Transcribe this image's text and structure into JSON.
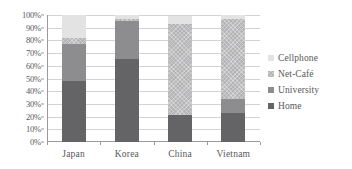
{
  "chart_data": {
    "type": "bar",
    "subtype": "100% stacked column",
    "title": "",
    "subtitle": "",
    "xlabel": "",
    "ylabel": "",
    "categories": [
      "Japan",
      "Korea",
      "China",
      "Vietnam"
    ],
    "series": [
      {
        "name": "Home",
        "color": "#646466",
        "values": [
          48,
          65,
          21,
          23
        ]
      },
      {
        "name": "University",
        "color": "#8d8d8f",
        "values": [
          29,
          30,
          0,
          11
        ]
      },
      {
        "name": "Net-Café",
        "color": "#b4b4b6",
        "values": [
          5,
          2,
          72,
          63
        ]
      },
      {
        "name": "Cellphone",
        "color": "#e3e3e4",
        "values": [
          18,
          3,
          6,
          3
        ]
      }
    ],
    "cumulative_tops": {
      "Japan": {
        "Home": 48,
        "University": 77,
        "Net-Café": 82,
        "Cellphone": 100
      },
      "Korea": {
        "Home": 65,
        "University": 95,
        "Net-Café": 97,
        "Cellphone": 100
      },
      "China": {
        "Home": 21,
        "University": 21,
        "Net-Café": 93,
        "Cellphone": 99
      },
      "Vietnam": {
        "Home": 23,
        "University": 34,
        "Net-Café": 97,
        "Cellphone": 100
      }
    },
    "ylim": [
      0,
      100
    ],
    "y_tick_labels": [
      "100%",
      "90%",
      "80%",
      "70%",
      "60%",
      "50%",
      "40%",
      "30%",
      "20%",
      "10%",
      "0%"
    ],
    "y_tick_values": [
      100,
      90,
      80,
      70,
      60,
      50,
      40,
      30,
      20,
      10,
      0
    ],
    "grid": true,
    "grid_axis": "y",
    "legend_position": "right",
    "legend_order_top_to_bottom": [
      "Cellphone",
      "Net-Café",
      "University",
      "Home"
    ],
    "colors": {
      "axis": "#9a9a9c",
      "gridline": "#d3d3d5",
      "text": "#58585a",
      "background": "#ffffff"
    }
  },
  "axes": {
    "y": {
      "ticks": [
        {
          "label": "100%",
          "value": 100
        },
        {
          "label": "90%",
          "value": 90
        },
        {
          "label": "80%",
          "value": 80
        },
        {
          "label": "70%",
          "value": 70
        },
        {
          "label": "60%",
          "value": 60
        },
        {
          "label": "50%",
          "value": 50
        },
        {
          "label": "40%",
          "value": 40
        },
        {
          "label": "30%",
          "value": 30
        },
        {
          "label": "20%",
          "value": 20
        },
        {
          "label": "10%",
          "value": 10
        },
        {
          "label": "0%",
          "value": 0
        }
      ]
    },
    "x": {
      "ticks": [
        {
          "label": "Japan"
        },
        {
          "label": "Korea"
        },
        {
          "label": "China"
        },
        {
          "label": "Vietnam"
        }
      ]
    }
  },
  "legend": {
    "items": [
      {
        "label": "Cellphone",
        "color": "#e3e3e4"
      },
      {
        "label": "Net-Café",
        "color": "#b4b4b6"
      },
      {
        "label": "University",
        "color": "#8d8d8f"
      },
      {
        "label": "Home",
        "color": "#646466"
      }
    ]
  }
}
